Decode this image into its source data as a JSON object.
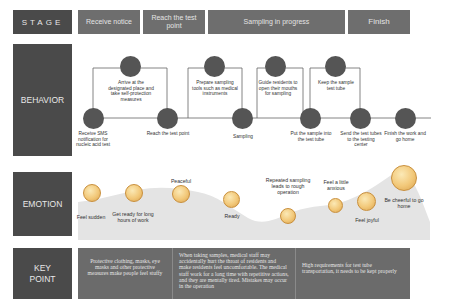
{
  "rows": {
    "stage": "STAGE",
    "behavior": "BEHAVIOR",
    "emotion": "EMOTION",
    "key_point": "KEY POINT"
  },
  "stages": [
    {
      "label": "Receive notice"
    },
    {
      "label": "Reach the test point"
    },
    {
      "label": "Sampling in progress"
    },
    {
      "label": "Finish"
    }
  ],
  "behaviors": [
    {
      "label": "Receive SMS notification for nucleic acid test"
    },
    {
      "label": "Arrive at the designated place and take self-protection measures"
    },
    {
      "label": "Reach the test point"
    },
    {
      "label": "Prepare sampling tools such as medical instruments"
    },
    {
      "label": "Sampling"
    },
    {
      "label": "Guide residents to open their mouths for sampling"
    },
    {
      "label": "Put the sample into the test tube"
    },
    {
      "label": "Keep the sample test tube"
    },
    {
      "label": "Send the test tubes to the testing center"
    },
    {
      "label": "Finish the work and go home"
    }
  ],
  "emotions": [
    {
      "label": "Feel sudden",
      "face": "shocked-face-icon"
    },
    {
      "label": "Get ready for long hours of work",
      "face": "determined-face-icon"
    },
    {
      "label": "Peaceful",
      "face": "calm-face-icon"
    },
    {
      "label": "Ready",
      "face": "neutral-face-icon"
    },
    {
      "label": "Repeated sampling leads to rough operation",
      "face": "worried-face-icon"
    },
    {
      "label": "Feel a little anxious",
      "face": "anxious-face-icon"
    },
    {
      "label": "Feel joyful",
      "face": "grinning-face-icon"
    },
    {
      "label": "Be cheerful to go home",
      "face": "big-grin-face-icon"
    }
  ],
  "key_points": [
    {
      "text": "Protective clothing, masks, eye masks and other protective measures make people feel stuffy"
    },
    {
      "text": "When taking samples, medical staff may accidentally hurt the throat of residents and make residents feel uncomfortable. The medical staff work for a long time with repetitive actions, and they are mentally tired. Mistakes may occur in the operation"
    },
    {
      "text": "High requirements for test tube transportation, it needs to be kept properly"
    }
  ],
  "colors": {
    "label_bg": "#4a4a4a",
    "stage_bg": "#6e6e6e",
    "node": "#555555",
    "emotion_area": "#e6e6e6",
    "keypoint_bg": "#6b6b6b"
  }
}
